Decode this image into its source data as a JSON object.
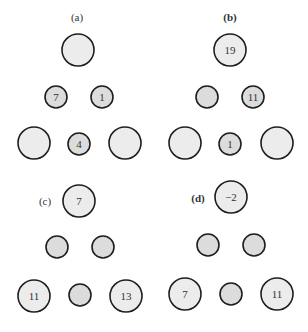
{
  "panels": [
    {
      "label": "(a)",
      "bold": false,
      "label_pos": [
        77,
        21
      ],
      "nodes": [
        {
          "x": 78,
          "y": 50,
          "r": 16,
          "value": ""
        },
        {
          "x": 56,
          "y": 97,
          "r": 11,
          "value": "7"
        },
        {
          "x": 102,
          "y": 97,
          "r": 11,
          "value": "1"
        },
        {
          "x": 34,
          "y": 143,
          "r": 16,
          "value": ""
        },
        {
          "x": 79,
          "y": 144,
          "r": 11,
          "value": "4"
        },
        {
          "x": 125,
          "y": 143,
          "r": 16,
          "value": ""
        }
      ]
    },
    {
      "label": "(b)",
      "bold": true,
      "label_pos": [
        230,
        21
      ],
      "nodes": [
        {
          "x": 230,
          "y": 50,
          "r": 16,
          "value": "19"
        },
        {
          "x": 207,
          "y": 97,
          "r": 11,
          "value": ""
        },
        {
          "x": 253,
          "y": 97,
          "r": 11,
          "value": "11"
        },
        {
          "x": 185,
          "y": 143,
          "r": 16,
          "value": ""
        },
        {
          "x": 230,
          "y": 144,
          "r": 11,
          "value": "1"
        },
        {
          "x": 277,
          "y": 143,
          "r": 16,
          "value": ""
        }
      ]
    },
    {
      "label": "(c)",
      "bold": false,
      "label_pos": [
        45,
        205
      ],
      "nodes": [
        {
          "x": 79,
          "y": 201,
          "r": 16,
          "value": "7"
        },
        {
          "x": 57,
          "y": 247,
          "r": 11,
          "value": ""
        },
        {
          "x": 103,
          "y": 247,
          "r": 11,
          "value": ""
        },
        {
          "x": 34,
          "y": 296,
          "r": 16,
          "value": "11"
        },
        {
          "x": 80,
          "y": 295,
          "r": 11,
          "value": ""
        },
        {
          "x": 126,
          "y": 296,
          "r": 16,
          "value": "13"
        }
      ]
    },
    {
      "label": "(d)",
      "bold": true,
      "label_pos": [
        198,
        202
      ],
      "nodes": [
        {
          "x": 231,
          "y": 197,
          "r": 16,
          "value": "−2"
        },
        {
          "x": 208,
          "y": 245,
          "r": 11,
          "value": ""
        },
        {
          "x": 254,
          "y": 245,
          "r": 11,
          "value": ""
        },
        {
          "x": 185,
          "y": 294,
          "r": 16,
          "value": "7"
        },
        {
          "x": 231,
          "y": 294,
          "r": 11,
          "value": ""
        },
        {
          "x": 277,
          "y": 294,
          "r": 16,
          "value": "11"
        }
      ]
    }
  ]
}
